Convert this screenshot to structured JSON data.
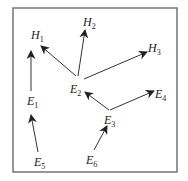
{
  "diagram": {
    "type": "directed-graph",
    "frame": {
      "x": 13,
      "y": 8,
      "width": 164,
      "height": 164,
      "color": "#6b6b6b"
    },
    "colors": {
      "edge": "#333333",
      "text": "#222222",
      "background": "#ffffff"
    },
    "nodes": [
      {
        "id": "H1",
        "letter": "H",
        "sub": "1",
        "x": 31,
        "y": 39
      },
      {
        "id": "H2",
        "letter": "H",
        "sub": "2",
        "x": 83,
        "y": 26
      },
      {
        "id": "H3",
        "letter": "H",
        "sub": "3",
        "x": 148,
        "y": 52
      },
      {
        "id": "E1",
        "letter": "E",
        "sub": "1",
        "x": 27,
        "y": 105
      },
      {
        "id": "E2",
        "letter": "E",
        "sub": "2",
        "x": 70,
        "y": 93
      },
      {
        "id": "E3",
        "letter": "E",
        "sub": "3",
        "x": 104,
        "y": 124
      },
      {
        "id": "E4",
        "letter": "E",
        "sub": "4",
        "x": 155,
        "y": 98
      },
      {
        "id": "E5",
        "letter": "E",
        "sub": "5",
        "x": 34,
        "y": 166
      },
      {
        "id": "E6",
        "letter": "E",
        "sub": "6",
        "x": 86,
        "y": 164
      }
    ],
    "edges": [
      {
        "from": "E5",
        "to": "E1",
        "x1": 38,
        "y1": 152,
        "x2": 31,
        "y2": 115
      },
      {
        "from": "E1",
        "to": "H1",
        "x1": 31,
        "y1": 91,
        "x2": 31,
        "y2": 51
      },
      {
        "from": "E2",
        "to": "H1",
        "x1": 76,
        "y1": 76,
        "x2": 41,
        "y2": 46
      },
      {
        "from": "E2",
        "to": "H2",
        "x1": 78,
        "y1": 76,
        "x2": 85,
        "y2": 30
      },
      {
        "from": "E2",
        "to": "H3",
        "x1": 84,
        "y1": 79,
        "x2": 147,
        "y2": 52
      },
      {
        "from": "E3",
        "to": "E2",
        "x1": 109,
        "y1": 110,
        "x2": 85,
        "y2": 92
      },
      {
        "from": "E3",
        "to": "E4",
        "x1": 110,
        "y1": 110,
        "x2": 154,
        "y2": 91
      },
      {
        "from": "E6",
        "to": "E3",
        "x1": 94,
        "y1": 150,
        "x2": 107,
        "y2": 126
      }
    ]
  }
}
